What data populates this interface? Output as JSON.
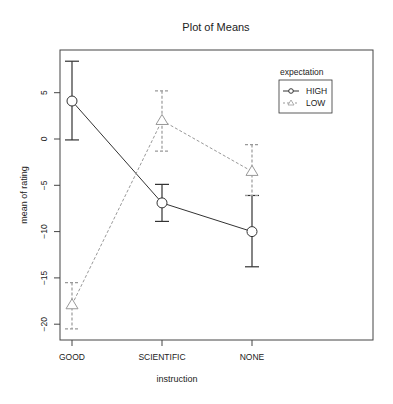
{
  "chart_data": {
    "type": "line",
    "title": "Plot of Means",
    "xlabel": "instruction",
    "ylabel": "mean of rating",
    "categories": [
      "GOOD",
      "SCIENTIFIC",
      "NONE"
    ],
    "ylim": [
      -22.2,
      9.6
    ],
    "yticks": [
      5,
      0,
      -5,
      -10,
      -15,
      -20
    ],
    "ytick_labels": [
      "5",
      "0",
      "-5",
      "-10",
      "-15",
      "-20"
    ],
    "grid": false,
    "legend": {
      "title": "expectation",
      "position": "top-right",
      "entries": [
        "HIGH",
        "LOW"
      ]
    },
    "series": [
      {
        "name": "HIGH",
        "marker": "circle",
        "line": "solid",
        "color": "#333333",
        "values": [
          4.1,
          -6.9,
          -10.0
        ],
        "err_upper": [
          8.4,
          -4.9,
          -6.1
        ],
        "err_lower": [
          -0.1,
          -8.9,
          -13.8
        ]
      },
      {
        "name": "LOW",
        "marker": "triangle",
        "line": "dashed",
        "color": "#999999",
        "values": [
          -17.9,
          2.0,
          -3.5
        ],
        "err_upper": [
          -15.5,
          5.2,
          -0.6
        ],
        "err_lower": [
          -20.5,
          -1.3,
          -6.1
        ]
      }
    ]
  }
}
